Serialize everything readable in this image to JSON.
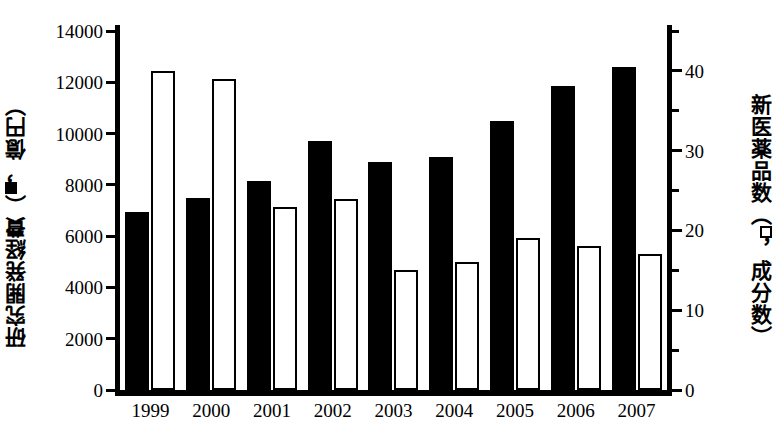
{
  "chart_data": {
    "type": "bar",
    "title": "",
    "categories": [
      "1999",
      "2000",
      "2001",
      "2002",
      "2003",
      "2004",
      "2005",
      "2006",
      "2007"
    ],
    "series": [
      {
        "name": "研究開発経費",
        "marker": "filled-square",
        "axis": "left",
        "unit": "億円",
        "values": [
          6950,
          7500,
          8150,
          9700,
          8900,
          9100,
          10500,
          11850,
          12600
        ]
      },
      {
        "name": "新医薬品数",
        "marker": "open-square",
        "axis": "right",
        "unit": "成分数",
        "values": [
          40,
          39,
          23,
          24,
          15,
          16,
          19,
          18,
          17
        ]
      }
    ],
    "xlabel": "",
    "ylabel_left": "研究開発経費（■，億円）",
    "ylabel_right": "新医薬品数（□，成分数）",
    "ylim_left": [
      0,
      14000
    ],
    "ylim_right": [
      0,
      45
    ],
    "yticks_left": [
      0,
      2000,
      4000,
      6000,
      8000,
      10000,
      12000,
      14000
    ],
    "yticks_right_major": [
      0,
      10,
      20,
      30,
      40
    ],
    "yticks_right_minor": [
      5,
      15,
      25,
      35,
      45
    ],
    "grid": false,
    "legend": "in-axis-titles"
  },
  "axes": {
    "left": {
      "title_prefix": "研究開発経費（",
      "title_suffix": "，億円）",
      "glyph": "filled-square-icon",
      "tick_labels": [
        "14000",
        "12000",
        "10000",
        "8000",
        "6000",
        "4000",
        "2000",
        "0"
      ]
    },
    "right": {
      "title_prefix": "新医薬品数（",
      "title_suffix": "，成分数）",
      "glyph": "open-square-icon",
      "tick_labels": [
        "40",
        "30",
        "20",
        "10",
        "0"
      ]
    },
    "x": {
      "tick_labels": [
        "1999",
        "2000",
        "2001",
        "2002",
        "2003",
        "2004",
        "2005",
        "2006",
        "2007"
      ]
    }
  },
  "colors": {
    "series_filled": "#000000",
    "series_open": "#ffffff",
    "outline": "#000000",
    "background": "#ffffff"
  }
}
